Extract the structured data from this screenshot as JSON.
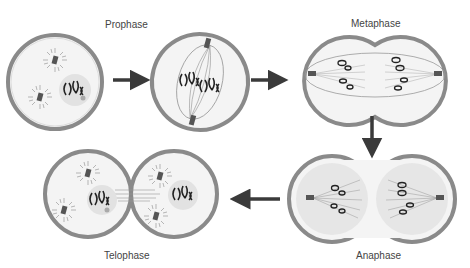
{
  "labels": {
    "prophase": "Prophase",
    "metaphase": "Metaphase",
    "anaphase": "Anaphase",
    "telophase": "Telophase"
  },
  "sequence": [
    "Prophase",
    "Prometaphase (unlabeled)",
    "Metaphase",
    "Anaphase",
    "Telophase"
  ],
  "colors": {
    "membrane_outer": "#8a8a8a",
    "membrane_fill": "#d9d9d9",
    "cytoplasm": "#f4f4f4",
    "nucleus": "#e2e2e2",
    "chromosome": "#222222",
    "arrow": "#3a3a3a",
    "centrosome": "#555555"
  }
}
